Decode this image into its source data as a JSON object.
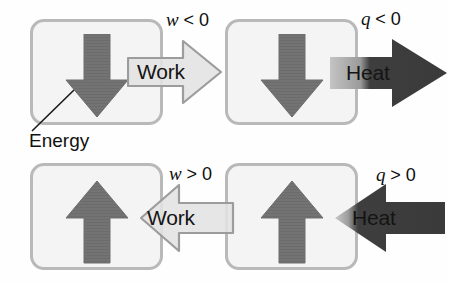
{
  "figure": {
    "callout": {
      "label": "Energy",
      "icon": "leader-line-icon"
    },
    "colors": {
      "box_fill": "#f4f4f4",
      "box_border": "#b9b9b9",
      "energy_arrow": "#737373",
      "energy_arrow_border": "#6a6a6a",
      "work_arrow_fill": "#e2e2e2",
      "work_arrow_border": "#9a9a9a",
      "heat_arrow_fill": "#3a3a3a",
      "heat_arrow_fade": "#bdbdbd",
      "text": "#111111"
    },
    "panels": [
      {
        "id": "top-left",
        "energy_direction": "down",
        "energy_icon": "arrow-down-icon",
        "flow_kind": "work",
        "flow_label": "Work",
        "flow_direction": "right",
        "flow_icon": "arrow-right-icon",
        "sign_symbol": "w",
        "sign_relation": "< 0"
      },
      {
        "id": "top-right",
        "energy_direction": "down",
        "energy_icon": "arrow-down-icon",
        "flow_kind": "heat",
        "flow_label": "Heat",
        "flow_direction": "right",
        "flow_icon": "arrow-right-icon",
        "sign_symbol": "q",
        "sign_relation": "< 0"
      },
      {
        "id": "bottom-left",
        "energy_direction": "up",
        "energy_icon": "arrow-up-icon",
        "flow_kind": "work",
        "flow_label": "Work",
        "flow_direction": "left",
        "flow_icon": "arrow-left-icon",
        "sign_symbol": "w",
        "sign_relation": "> 0"
      },
      {
        "id": "bottom-right",
        "energy_direction": "up",
        "energy_icon": "arrow-up-icon",
        "flow_kind": "heat",
        "flow_label": "Heat",
        "flow_direction": "left",
        "flow_icon": "arrow-left-icon",
        "sign_symbol": "q",
        "sign_relation": "> 0"
      }
    ]
  }
}
